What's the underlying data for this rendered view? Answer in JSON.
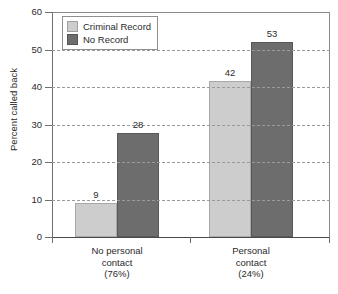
{
  "chart_data": {
    "type": "bar",
    "title": "",
    "xlabel": "",
    "ylabel": "Percent called back",
    "ylim": [
      0,
      60
    ],
    "yticks": [
      0,
      10,
      20,
      30,
      40,
      50,
      60
    ],
    "ytick_labels": [
      "0",
      "10",
      "20",
      "30",
      "40",
      "50",
      "60"
    ],
    "grid": "horizontal-dashed",
    "legend_position": "upper-left-inside",
    "categories": [
      "No personal contact (76%)",
      "Personal contact (24%)"
    ],
    "category_lines": [
      [
        "No personal",
        "contact",
        "(76%)"
      ],
      [
        "Personal",
        "contact",
        "(24%)"
      ]
    ],
    "series": [
      {
        "name": "Criminal Record",
        "color": "#cdcdcd",
        "values": [
          9,
          42
        ],
        "plotted": [
          9.0,
          41.5
        ],
        "labels": [
          "9",
          "42"
        ]
      },
      {
        "name": "No Record",
        "color": "#6d6d6d",
        "values": [
          28,
          53
        ],
        "plotted": [
          27.7,
          52.0
        ],
        "labels": [
          "28",
          "53"
        ]
      }
    ]
  },
  "legend": {
    "items": [
      {
        "label": "Criminal Record",
        "swatch": "light"
      },
      {
        "label": "No Record",
        "swatch": "dark"
      }
    ]
  },
  "axis": {
    "y_title": "Percent called back"
  }
}
